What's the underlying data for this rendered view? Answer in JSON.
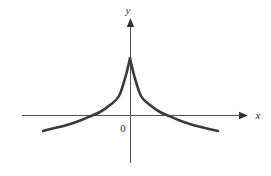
{
  "figure": {
    "background_color": "#ffffff",
    "width": 271,
    "height": 176,
    "axis_color": "#555555",
    "curve_color": "#3a3a3a",
    "label_color": "#2b2b2b"
  },
  "labels": {
    "y_axis": "y",
    "x_axis": "x",
    "origin": "0"
  },
  "chart_data": {
    "type": "line",
    "title": "",
    "subtitle": "",
    "xlabel": "x",
    "ylabel": "y",
    "grid": false,
    "legend": null,
    "annotations": [
      {
        "text": "0",
        "x": 0,
        "y": 0,
        "note": "origin label, placed below-right of origin"
      },
      {
        "text": "y",
        "x": 0,
        "y": 1.15,
        "note": "y-axis label at arrow tip"
      },
      {
        "text": "x",
        "x": 1.2,
        "y": 0,
        "note": "x-axis label at arrow tip"
      }
    ],
    "xlim": [
      -1.0,
      1.0
    ],
    "ylim": [
      -0.35,
      1.05
    ],
    "axes": {
      "x_axis_pixel_y": 115,
      "y_axis_pixel_x": 130,
      "x_axis_pixel_start": 22,
      "x_axis_pixel_end": 248,
      "y_axis_pixel_top": 18,
      "y_axis_pixel_bottom": 163
    },
    "series": [
      {
        "name": "y = f(x)",
        "x": [
          -0.77,
          -0.67,
          -0.57,
          -0.47,
          -0.37,
          -0.3,
          -0.22,
          -0.15,
          -0.08,
          0.0,
          0.08,
          0.15,
          0.22,
          0.3,
          0.37,
          0.47,
          0.57,
          0.67,
          0.77
        ],
        "y": [
          -0.28,
          -0.24,
          -0.2,
          -0.15,
          -0.09,
          -0.04,
          0.06,
          0.18,
          0.45,
          1.0,
          0.45,
          0.18,
          0.06,
          -0.04,
          -0.09,
          -0.15,
          -0.2,
          -0.24,
          -0.28
        ],
        "pixel_points": [
          [
            43,
            131
          ],
          [
            55,
            128
          ],
          [
            67,
            125
          ],
          [
            79,
            121
          ],
          [
            91,
            116
          ],
          [
            100,
            112
          ],
          [
            110,
            105
          ],
          [
            119,
            96
          ],
          [
            126,
            75
          ],
          [
            130,
            58
          ],
          [
            134,
            75
          ],
          [
            141,
            96
          ],
          [
            150,
            105
          ],
          [
            160,
            112
          ],
          [
            169,
            116
          ],
          [
            181,
            121
          ],
          [
            193,
            125
          ],
          [
            205,
            128
          ],
          [
            218,
            131
          ]
        ],
        "cusp_pixel": [
          130,
          58
        ],
        "x_axis_crossings_pixel": [
          77,
          184
        ]
      }
    ]
  }
}
